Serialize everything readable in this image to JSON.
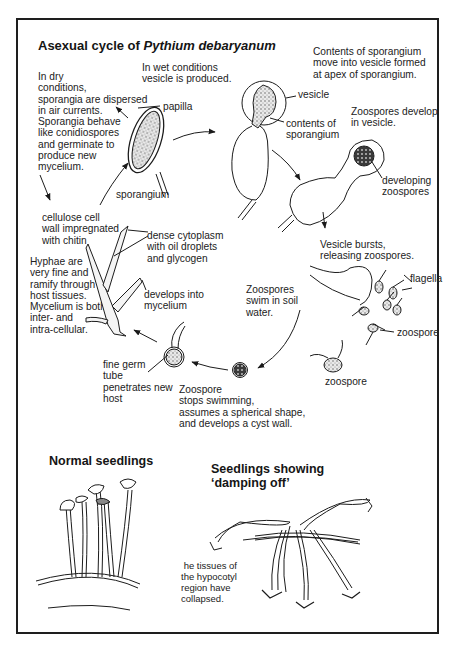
{
  "figure": {
    "title_prefix": "Asexual cycle of ",
    "title_species": "Pythium debaryanum",
    "stages": {
      "wet_conditions": "In wet conditions\nvesicle is produced.",
      "dry_conditions": "In dry\nconditions,\nsporangia are dispersed\nin air currents.\nSporangia behave\nlike conidiospores\nand germinate to\nproduce new\nmycelium.",
      "contents_move": "Contents of sporangium\nmove into vesicle formed\nat apex of sporangium.",
      "zoospores_develop": "Zoospores develop\nin vesicle.",
      "vesicle_bursts": "Vesicle bursts,\nreleasing zoospores.",
      "zoospores_swim": "Zoospores\nswim in soil\nwater.",
      "zoospore_stops": "Zoospore\nstops swimming,\nassumes a spherical shape,\nand develops a cyst wall.",
      "germ_tube": "fine germ\ntube\npenetrates new\nhost",
      "hyphae": "Hyphae are\nvery fine and\nramify through\nhost tissues.\nMycelium is both\ninter- and\nintra-cellular."
    },
    "labels": {
      "papilla": "papilla",
      "sporangium": "sporangium",
      "vesicle": "vesicle",
      "contents_of_sporangium": "contents of\nsporangium",
      "developing_zoospores": "developing\nzoospores",
      "flagella": "flagella",
      "zoospore_1": "zoospore",
      "zoospore_2": "zoospore",
      "cell_wall": "cellulose cell\nwall impregnated\nwith chitin",
      "dense_cytoplasm": "dense cytoplasm\nwith oil droplets\nand glycogen",
      "develops_into_mycelium": "develops into\nmycelium"
    },
    "seedlings": {
      "normal_title": "Normal seedlings",
      "damping_title": "Seedlings showing\n‘damping off’",
      "collapsed_note": " he tissues of\nthe hypocotyl\nregion have\ncollapsed."
    }
  }
}
